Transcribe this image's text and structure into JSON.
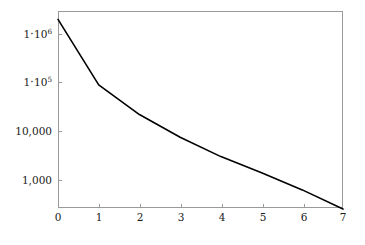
{
  "chart_data": {
    "type": "line",
    "title": "",
    "subtitle": "",
    "xlabel": "",
    "ylabel": "",
    "yscale": "log",
    "xscale": "linear",
    "grid": false,
    "legend": null,
    "legend_position": "none",
    "xlim": [
      0,
      7
    ],
    "ylim": [
      250,
      2000000
    ],
    "x": [
      0,
      1,
      2,
      3,
      4,
      5,
      6,
      7
    ],
    "series": [
      {
        "name": "error",
        "values": [
          2000000,
          90000,
          22000,
          7500,
          3000,
          1400,
          620,
          250
        ]
      }
    ],
    "xticks": [
      0,
      1,
      2,
      3,
      4,
      5,
      6,
      7
    ],
    "xticklabels": [
      "0",
      "1",
      "2",
      "3",
      "4",
      "5",
      "6",
      "7"
    ],
    "yticks": [
      1000,
      10000,
      100000,
      1000000
    ],
    "yticklabels": [
      "1,000",
      "10,000",
      "1 · 10⁵",
      "1 · 10⁶"
    ],
    "line_color": "#000000",
    "axis_color": "#9a9a9a",
    "background_color": "#ffffff"
  },
  "axes": {
    "y_labels": [
      {
        "mantissa": "1",
        "dot": "·",
        "base": "10",
        "exp": "6",
        "plain": "",
        "value": 1000000
      },
      {
        "mantissa": "1",
        "dot": "·",
        "base": "10",
        "exp": "5",
        "plain": "",
        "value": 100000
      },
      {
        "mantissa": "",
        "dot": "",
        "base": "",
        "exp": "",
        "plain": "10,000",
        "value": 10000
      },
      {
        "mantissa": "",
        "dot": "",
        "base": "",
        "exp": "",
        "plain": "1,000",
        "value": 1000
      }
    ],
    "x_labels": [
      "0",
      "1",
      "2",
      "3",
      "4",
      "5",
      "6",
      "7"
    ]
  }
}
